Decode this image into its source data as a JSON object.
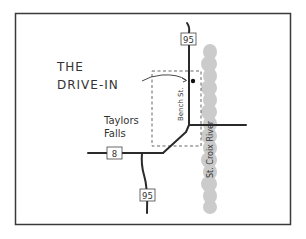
{
  "map": {
    "title_line1": "THE",
    "title_line2": "DRIVE-IN",
    "town_line1": "Taylors",
    "town_line2": "Falls",
    "street": "Bench St.",
    "river": "St. Croix River",
    "shields": {
      "hwy95_north": "95",
      "hwy8": "8",
      "hwy95_south": "95"
    },
    "colors": {
      "road": "#2a2a2a",
      "river": "#c8c8c8",
      "border": "#3a3a3a",
      "dashed": "#555555",
      "text": "#333333"
    }
  }
}
